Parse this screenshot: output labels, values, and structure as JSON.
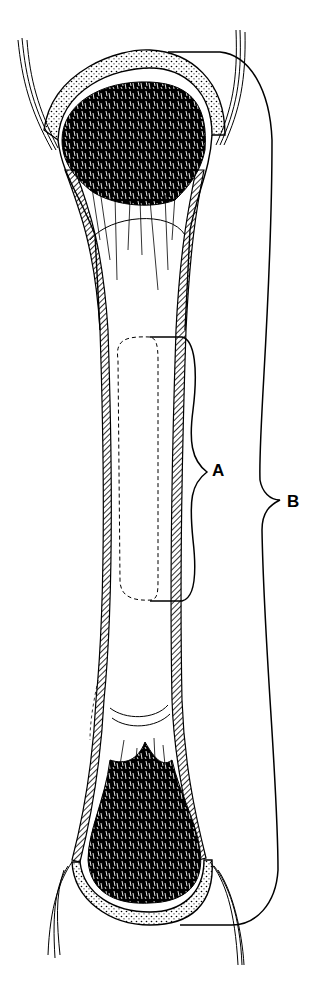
{
  "figure": {
    "type": "anatomical-line-drawing",
    "colors": {
      "ink": "#000000",
      "background": "#ffffff"
    }
  },
  "labels": {
    "a": "A",
    "b": "B"
  },
  "brackets": [
    {
      "id": "A",
      "spans": "mid-shaft region outlined by dashed contour"
    },
    {
      "id": "B",
      "spans": "entire bone length from proximal to distal end"
    }
  ]
}
